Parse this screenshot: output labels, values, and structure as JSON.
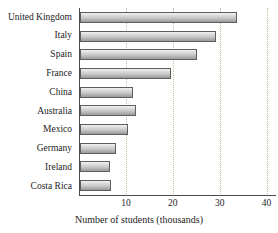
{
  "chart_data": {
    "type": "bar",
    "orientation": "horizontal",
    "title": "",
    "xlabel": "Number of students (thousands)",
    "ylabel": "",
    "categories": [
      "United Kingdom",
      "Italy",
      "Spain",
      "France",
      "China",
      "Australia",
      "Mexico",
      "Germany",
      "Ireland",
      "Costa Rica"
    ],
    "values": [
      33.5,
      29.0,
      25.0,
      19.4,
      11.3,
      12.0,
      10.2,
      7.6,
      6.5,
      6.7
    ],
    "xlim": [
      0,
      42
    ],
    "xticks": [
      10,
      20,
      30,
      40
    ],
    "xtick_labels": [
      "10",
      "20",
      "30",
      "40"
    ],
    "grid": "vertical-dotted",
    "legend": "none",
    "bar_edge_color": "#5e5e5e",
    "bar_fill_top": "#f2f2f2",
    "bar_fill_bottom": "#9a9a9a",
    "axis_color": "#4a4a4a",
    "gridline_color": "#c9b9a0"
  }
}
